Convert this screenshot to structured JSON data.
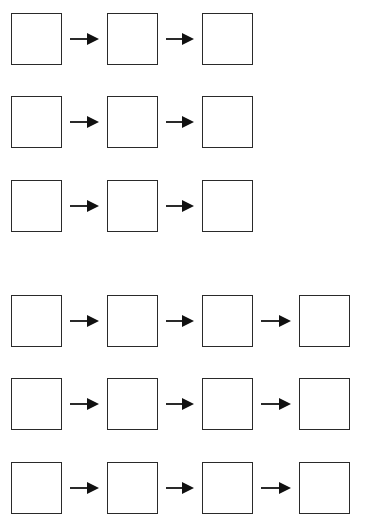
{
  "diagram": {
    "type": "sequence-boxes",
    "stroke_color": "#2a2a2a",
    "groups": [
      {
        "rows": [
          {
            "y": 13,
            "boxes": 3
          },
          {
            "y": 96,
            "boxes": 3
          },
          {
            "y": 180,
            "boxes": 3
          }
        ]
      },
      {
        "rows": [
          {
            "y": 295,
            "boxes": 4
          },
          {
            "y": 378,
            "boxes": 4
          },
          {
            "y": 462,
            "boxes": 4
          }
        ]
      }
    ],
    "box_x": [
      11,
      107,
      202,
      299
    ],
    "arrow_icon": "right-arrow-icon"
  }
}
